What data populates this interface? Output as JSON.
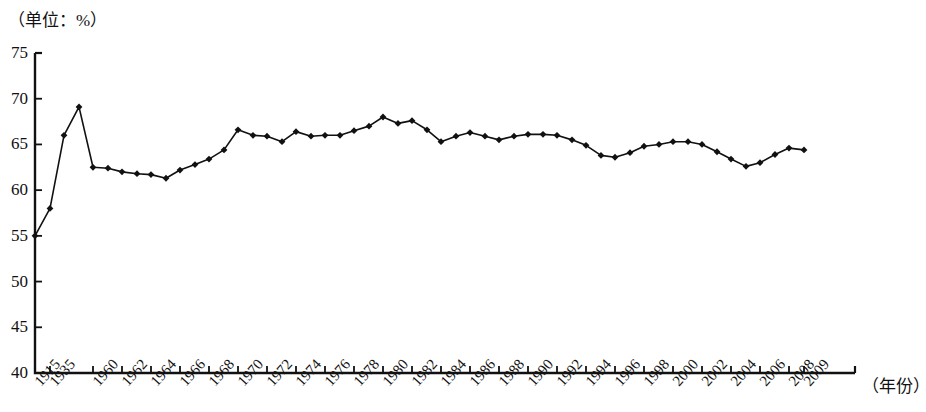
{
  "chart_data": {
    "type": "line",
    "title": "",
    "unit_label": "（单位：%）",
    "xlabel": "（年份）",
    "ylabel": "",
    "ylim": [
      40,
      75
    ],
    "y_ticks": [
      40,
      45,
      50,
      55,
      60,
      65,
      70,
      75
    ],
    "grid": false,
    "legend": "none",
    "marker": "diamond",
    "line_color": "#111111",
    "x_tick_labels": [
      "1915",
      "1935",
      "1960",
      "1962",
      "1964",
      "1966",
      "1968",
      "1970",
      "1972",
      "1974",
      "1976",
      "1978",
      "1980",
      "1982",
      "1984",
      "1986",
      "1988",
      "1990",
      "1992",
      "1994",
      "1996",
      "1998",
      "2000",
      "2002",
      "2004",
      "2006",
      "2008",
      "2009"
    ],
    "x": [
      "1915",
      "1935",
      "1945",
      "1950",
      "1960",
      "1961",
      "1962",
      "1963",
      "1964",
      "1965",
      "1966",
      "1967",
      "1968",
      "1969",
      "1970",
      "1971",
      "1972",
      "1973",
      "1974",
      "1975",
      "1976",
      "1977",
      "1978",
      "1979",
      "1980",
      "1981",
      "1982",
      "1983",
      "1984",
      "1985",
      "1986",
      "1987",
      "1988",
      "1989",
      "1990",
      "1991",
      "1992",
      "1993",
      "1994",
      "1995",
      "1996",
      "1997",
      "1998",
      "1999",
      "2000",
      "2001",
      "2002",
      "2003",
      "2004",
      "2005",
      "2006",
      "2007",
      "2008",
      "2009"
    ],
    "values": [
      55.0,
      58.0,
      66.0,
      69.1,
      62.5,
      62.4,
      62.0,
      61.8,
      61.7,
      61.3,
      62.2,
      62.8,
      63.4,
      64.4,
      66.6,
      66.0,
      65.9,
      65.3,
      66.4,
      65.9,
      66.0,
      66.0,
      66.5,
      67.0,
      68.0,
      67.3,
      67.6,
      66.6,
      65.3,
      65.9,
      66.3,
      65.9,
      65.5,
      65.9,
      66.1,
      66.1,
      66.0,
      65.5,
      64.9,
      63.8,
      63.6,
      64.1,
      64.8,
      65.0,
      65.3,
      65.3,
      65.0,
      64.2,
      63.4,
      62.6,
      63.0,
      63.9,
      64.6,
      64.4
    ],
    "x_pixels": [
      35,
      50,
      64,
      79,
      93,
      108,
      122,
      137,
      151,
      166,
      180,
      195,
      209,
      224,
      238,
      253,
      267,
      282,
      296,
      311,
      325,
      340,
      354,
      369,
      383,
      398,
      412,
      427,
      441,
      456,
      470,
      485,
      499,
      514,
      528,
      543,
      557,
      572,
      586,
      601,
      615,
      630,
      644,
      659,
      673,
      688,
      702,
      717,
      731,
      746,
      760,
      775,
      789,
      804
    ],
    "x_tick_pixels": [
      35,
      50,
      93,
      122,
      151,
      180,
      209,
      238,
      267,
      296,
      325,
      354,
      383,
      412,
      441,
      470,
      499,
      528,
      557,
      586,
      615,
      644,
      673,
      702,
      731,
      760,
      789,
      804
    ],
    "axis_pixels": {
      "x0": 35,
      "x1": 855,
      "y_top": 53,
      "y_bottom": 373
    }
  }
}
